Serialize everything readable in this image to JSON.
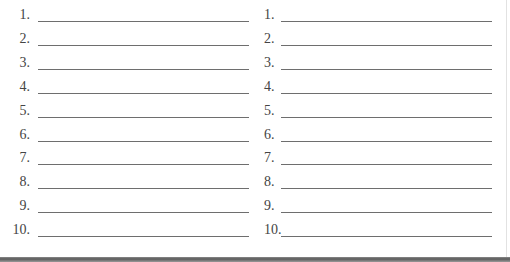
{
  "worksheet": {
    "left_column": {
      "items": [
        {
          "number": "1.",
          "value": ""
        },
        {
          "number": "2.",
          "value": ""
        },
        {
          "number": "3.",
          "value": ""
        },
        {
          "number": "4.",
          "value": ""
        },
        {
          "number": "5.",
          "value": ""
        },
        {
          "number": "6.",
          "value": ""
        },
        {
          "number": "7.",
          "value": ""
        },
        {
          "number": "8.",
          "value": ""
        },
        {
          "number": "9.",
          "value": ""
        },
        {
          "number": "10.",
          "value": ""
        }
      ]
    },
    "right_column": {
      "items": [
        {
          "number": "1.",
          "value": ""
        },
        {
          "number": "2.",
          "value": ""
        },
        {
          "number": "3.",
          "value": ""
        },
        {
          "number": "4.",
          "value": ""
        },
        {
          "number": "5.",
          "value": ""
        },
        {
          "number": "6.",
          "value": ""
        },
        {
          "number": "7.",
          "value": ""
        },
        {
          "number": "8.",
          "value": ""
        },
        {
          "number": "9.",
          "value": ""
        },
        {
          "number": "10.",
          "value": ""
        }
      ]
    }
  },
  "colors": {
    "line": "#6e6e6e",
    "text": "#444444",
    "bottom_border": "#5a5a5a"
  }
}
